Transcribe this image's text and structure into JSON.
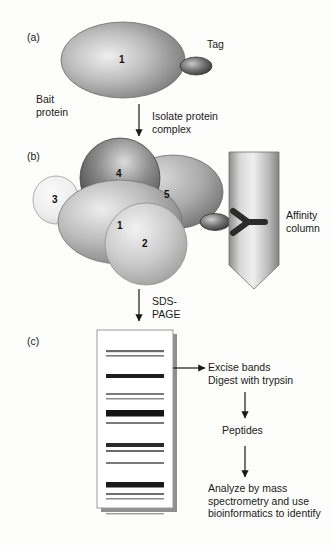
{
  "figure": {
    "background_color": "#fdfdfb",
    "ink_color": "#1a1a1a"
  },
  "panels": [
    {
      "id": "a",
      "label": "(a)"
    },
    {
      "id": "b",
      "label": "(b)"
    },
    {
      "id": "c",
      "label": "(c)"
    }
  ],
  "panel_a": {
    "bait_label": "Bait\nprotein",
    "bait_subunit_number": "1",
    "tag_label": "Tag",
    "bait_fill_light": "#e8e8e8",
    "bait_fill_dark": "#6f6f6f",
    "tag_fill_dark": "#3c3c3c"
  },
  "panel_b": {
    "subunits": [
      {
        "number": "1",
        "shade": "#b4b4b4"
      },
      {
        "number": "2",
        "shade": "#c3c3c3"
      },
      {
        "number": "3",
        "shade": "#ededed"
      },
      {
        "number": "4",
        "shade": "#5a5a5a"
      },
      {
        "number": "5",
        "shade": "#a0a0a0"
      }
    ],
    "column_label": "Affinity\ncolumn",
    "column_fill_light": "#e6e6e6",
    "column_fill_dark": "#8e8e8e",
    "antibody_color": "#2b2b2b"
  },
  "panel_c": {
    "gel_fill": "#ffffff",
    "gel_border": "#9a9a9a",
    "gel_shadow": "#8a8a8a",
    "bands": [
      {
        "y": 20,
        "thickness": 2.2,
        "color": "#6a6a6a"
      },
      {
        "y": 25,
        "thickness": 1.6,
        "color": "#7d7d7d"
      },
      {
        "y": 44,
        "thickness": 4.0,
        "color": "#1e1e1e"
      },
      {
        "y": 63,
        "thickness": 2.0,
        "color": "#7a7a7a"
      },
      {
        "y": 68,
        "thickness": 1.5,
        "color": "#8b8b8b"
      },
      {
        "y": 80,
        "thickness": 6.5,
        "color": "#151515"
      },
      {
        "y": 92,
        "thickness": 2.0,
        "color": "#7a7a7a"
      },
      {
        "y": 113,
        "thickness": 4.0,
        "color": "#2a2a2a"
      },
      {
        "y": 120,
        "thickness": 2.0,
        "color": "#6a6a6a"
      },
      {
        "y": 132,
        "thickness": 2.0,
        "color": "#7a7a7a"
      },
      {
        "y": 152,
        "thickness": 5.5,
        "color": "#1a1a1a"
      },
      {
        "y": 163,
        "thickness": 2.0,
        "color": "#6f6f6f"
      },
      {
        "y": 168,
        "thickness": 1.5,
        "color": "#8b8b8b"
      },
      {
        "y": 183,
        "thickness": 1.4,
        "color": "#9a9a9a"
      }
    ]
  },
  "arrows": {
    "isolate_label": "Isolate protein\ncomplex",
    "sds_page_label": "SDS-\nPAGE",
    "excise_label": "Excise bands\nDigest with trypsin",
    "peptides_label": "Peptides",
    "analyze_label": "Analyze by mass\nspectrometry and use\nbioinformatics to identify"
  }
}
